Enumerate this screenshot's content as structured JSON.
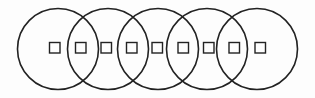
{
  "diagram": {
    "stroke_color": "#222222",
    "background": "#fdfdfd",
    "circles": [
      {
        "cx": 58,
        "cy": 49,
        "r": 40.5
      },
      {
        "cx": 108,
        "cy": 49,
        "r": 40.5
      },
      {
        "cx": 158,
        "cy": 49,
        "r": 40.5
      },
      {
        "cx": 207,
        "cy": 49,
        "r": 40.5
      },
      {
        "cx": 257,
        "cy": 49,
        "r": 40.5
      }
    ],
    "squares": [
      {
        "x": 49.5,
        "y": 42.5,
        "size": 10.5
      },
      {
        "x": 75.5,
        "y": 42.5,
        "size": 10.5
      },
      {
        "x": 101,
        "y": 42.5,
        "size": 10.5
      },
      {
        "x": 126.5,
        "y": 42.5,
        "size": 10.5
      },
      {
        "x": 152,
        "y": 42.5,
        "size": 10.5
      },
      {
        "x": 178,
        "y": 42.5,
        "size": 10.5
      },
      {
        "x": 203.5,
        "y": 42.5,
        "size": 10.5
      },
      {
        "x": 229,
        "y": 42.5,
        "size": 10.5
      },
      {
        "x": 255,
        "y": 42.5,
        "size": 10.5
      }
    ]
  }
}
